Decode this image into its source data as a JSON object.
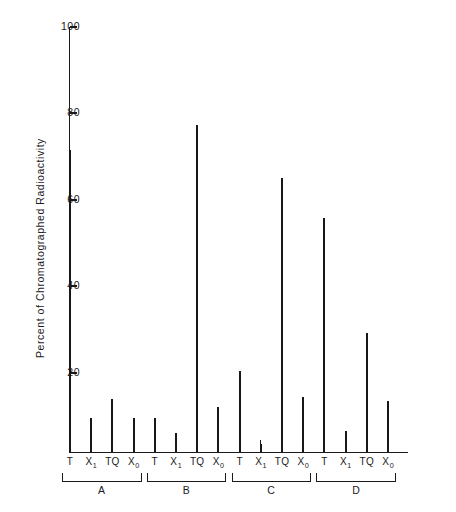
{
  "chart_data": {
    "type": "bar",
    "title": "",
    "xlabel": "",
    "ylabel": "Percent of Chromatographed Radioactivity",
    "ylim": [
      0,
      100
    ],
    "yticks": [
      0,
      20,
      40,
      60,
      80,
      100
    ],
    "ytick_labels": [
      "",
      "20",
      "40",
      "60",
      "80",
      "100"
    ],
    "grid": false,
    "legend": null,
    "groups": [
      {
        "name": "A",
        "categories": [
          "T",
          "X1",
          "TQ",
          "X0"
        ],
        "values": [
          71,
          8,
          12.5,
          8
        ]
      },
      {
        "name": "B",
        "categories": [
          "T",
          "X1",
          "TQ",
          "X0"
        ],
        "values": [
          8,
          4.5,
          77,
          10.5
        ]
      },
      {
        "name": "C",
        "categories": [
          "T",
          "X1",
          "TQ",
          "X0"
        ],
        "values": [
          19,
          2,
          64.5,
          13
        ]
      },
      {
        "name": "D",
        "categories": [
          "T",
          "X1",
          "TQ",
          "X0"
        ],
        "values": [
          55,
          5,
          28,
          12
        ]
      }
    ],
    "categories": [
      "T",
      "X1",
      "TQ",
      "X0",
      "T",
      "X1",
      "TQ",
      "X0",
      "T",
      "X1",
      "TQ",
      "X0",
      "T",
      "X1",
      "TQ",
      "X0"
    ],
    "values": [
      71,
      8,
      12.5,
      8,
      8,
      4.5,
      77,
      10.5,
      19,
      2,
      64.5,
      13,
      55,
      5,
      28,
      12
    ],
    "series": [
      {
        "name": "Percent of Chromatographed Radioactivity",
        "values": [
          71,
          8,
          12.5,
          8,
          8,
          4.5,
          77,
          10.5,
          19,
          2,
          64.5,
          13,
          55,
          5,
          28,
          12
        ]
      }
    ],
    "bar_color": "#171717",
    "axis_color": "#1a1a1a"
  },
  "axis": {
    "y_title": "Percent of Chromatographed Radioactivity",
    "tick_100": "100",
    "tick_80": "80",
    "tick_60": "60",
    "tick_40": "40",
    "tick_20": "20"
  },
  "x_labels": [
    {
      "main": "T",
      "sub": ""
    },
    {
      "main": "X",
      "sub": "1"
    },
    {
      "main": "TQ",
      "sub": ""
    },
    {
      "main": "X",
      "sub": "0"
    },
    {
      "main": "T",
      "sub": ""
    },
    {
      "main": "X",
      "sub": "1"
    },
    {
      "main": "TQ",
      "sub": ""
    },
    {
      "main": "X",
      "sub": "0"
    },
    {
      "main": "T",
      "sub": ""
    },
    {
      "main": "X",
      "sub": "1"
    },
    {
      "main": "TQ",
      "sub": ""
    },
    {
      "main": "X",
      "sub": "0"
    },
    {
      "main": "T",
      "sub": ""
    },
    {
      "main": "X",
      "sub": "1"
    },
    {
      "main": "TQ",
      "sub": ""
    },
    {
      "main": "X",
      "sub": "0"
    }
  ],
  "group_labels": [
    "A",
    "B",
    "C",
    "D"
  ]
}
